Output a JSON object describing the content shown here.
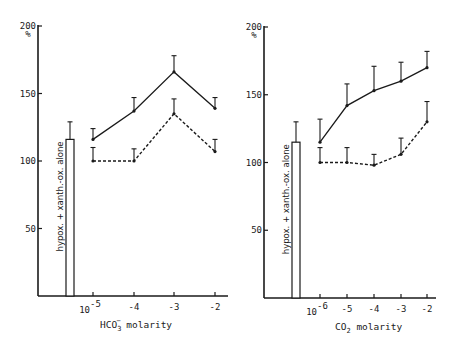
{
  "chart_data": [
    {
      "type": "line",
      "panel": "left",
      "ylabel": "%",
      "xlabel": "HCO3- molarity",
      "xlabel_main": "HCO",
      "xlabel_sub": "3",
      "xlabel_sup": "−",
      "xlabel_rest": " molarity",
      "ylim": [
        0,
        200
      ],
      "yticks": [
        50,
        100,
        150,
        200
      ],
      "ytick_labels": [
        "50",
        "100",
        "150",
        "200"
      ],
      "x_tick_labels": [
        "10",
        "-4",
        "-3",
        "-2"
      ],
      "x_first_exponent": "-5",
      "categories": [
        "10^-5",
        "10^-4",
        "10^-3",
        "10^-2"
      ],
      "control_bar": {
        "label": "hypox. + xanth.-ox. alone",
        "value": 116,
        "error": 13
      },
      "series": [
        {
          "name": "solid",
          "style": "solid",
          "values": [
            116,
            137,
            166,
            139
          ],
          "errors": [
            8,
            10,
            12,
            8
          ]
        },
        {
          "name": "dashed",
          "style": "dashed",
          "values": [
            100,
            100,
            135,
            107
          ],
          "errors": [
            10,
            9,
            11,
            9
          ]
        }
      ],
      "grid": false
    },
    {
      "type": "line",
      "panel": "right",
      "ylabel": "%",
      "xlabel": "CO2 molarity",
      "xlabel_main": "CO",
      "xlabel_sub": "2",
      "xlabel_sup": "",
      "xlabel_rest": " molarity",
      "ylim": [
        0,
        200
      ],
      "yticks": [
        50,
        100,
        150,
        200
      ],
      "ytick_labels": [
        "50",
        "100",
        "150",
        "200"
      ],
      "x_tick_labels": [
        "10",
        "-5",
        "-4",
        "-3",
        "-2"
      ],
      "x_first_exponent": "-6",
      "categories": [
        "10^-6",
        "10^-5",
        "10^-4",
        "10^-3",
        "10^-2"
      ],
      "control_bar": {
        "label": "hypox. + xanth.-ox. alone",
        "value": 115,
        "error": 15
      },
      "series": [
        {
          "name": "solid",
          "style": "solid",
          "values": [
            115,
            142,
            153,
            160,
            170
          ],
          "errors": [
            17,
            16,
            18,
            14,
            12
          ]
        },
        {
          "name": "dashed",
          "style": "dashed",
          "values": [
            100,
            100,
            98,
            106,
            130
          ],
          "errors": [
            11,
            11,
            8,
            12,
            15
          ]
        }
      ],
      "grid": false
    }
  ]
}
